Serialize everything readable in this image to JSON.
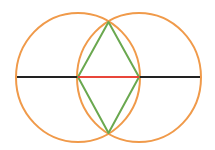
{
  "diagram": {
    "type": "vesica-piscis-construction",
    "canvas": {
      "width": 215,
      "height": 150,
      "background": "#ffffff"
    },
    "colors": {
      "circle": "#F09A4A",
      "rhombus": "#6AA84F",
      "center_segment": "#E8463A",
      "axis_line": "#222222"
    },
    "circles": [
      {
        "name": "left-circle",
        "cx": 78,
        "cy": 77.5,
        "rx": 62,
        "ry": 64.5
      },
      {
        "name": "right-circle",
        "cx": 139,
        "cy": 77.5,
        "rx": 62,
        "ry": 64.5
      }
    ],
    "axis_segments": [
      {
        "name": "left-axis-segment",
        "x1": 17,
        "y1": 77,
        "x2": 78,
        "y2": 77
      },
      {
        "name": "right-axis-segment",
        "x1": 139,
        "y1": 77,
        "x2": 200,
        "y2": 77
      }
    ],
    "center_segment": {
      "x1": 78,
      "y1": 77,
      "x2": 139,
      "y2": 77
    },
    "rhombus": {
      "points": [
        [
          108.5,
          22
        ],
        [
          139,
          77
        ],
        [
          108.5,
          133
        ],
        [
          78,
          77
        ]
      ]
    },
    "intersections": {
      "top": [
        108.5,
        22
      ],
      "bottom": [
        108.5,
        133
      ]
    }
  }
}
